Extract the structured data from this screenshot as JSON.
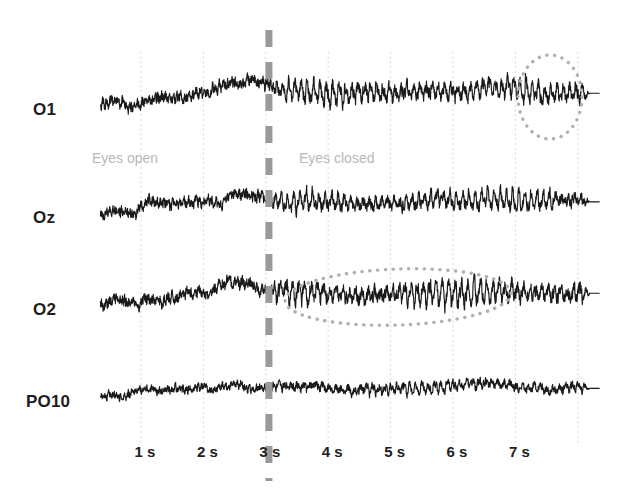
{
  "figure": {
    "width": 626,
    "height": 495,
    "background": "#ffffff"
  },
  "chart_data": {
    "type": "line",
    "title": "",
    "subtitle": "",
    "xlabel": "",
    "ylabel": "",
    "grid": true,
    "legend_position": "none",
    "x": {
      "unit": "s",
      "range": [
        0.35,
        8.35
      ],
      "tick_values": [
        1,
        2,
        3,
        4,
        5,
        6,
        7
      ],
      "tick_labels": [
        "1 s",
        "2 s",
        "3 s",
        "4 s",
        "5 s",
        "6 s",
        "7 s"
      ],
      "gridline_values": [
        1,
        2,
        3,
        4,
        5,
        6,
        7,
        8
      ],
      "gridline_color": "#cfcfcf"
    },
    "series": [
      {
        "name": "O1",
        "label": "O1",
        "baseline_y": 100,
        "trace_color": "#1a1a1a",
        "noise_amplitude_open": 7.5,
        "noise_amplitude_closed": 9.0,
        "alpha_amplitude": 8.5,
        "alpha_frequency_hz": 10.0,
        "drift_rise": 14
      },
      {
        "name": "Oz",
        "label": "Oz",
        "baseline_y": 208,
        "trace_color": "#1a1a1a",
        "noise_amplitude_open": 7.0,
        "noise_amplitude_closed": 8.0,
        "alpha_amplitude": 8.0,
        "alpha_frequency_hz": 10.0,
        "drift_rise": 13
      },
      {
        "name": "O2",
        "label": "O2",
        "baseline_y": 300,
        "trace_color": "#1a1a1a",
        "noise_amplitude_open": 7.5,
        "noise_amplitude_closed": 9.5,
        "alpha_amplitude": 10.5,
        "alpha_frequency_hz": 10.0,
        "drift_rise": 14
      },
      {
        "name": "PO10",
        "label": "PO10",
        "baseline_y": 392,
        "trace_color": "#1a1a1a",
        "noise_amplitude_open": 5.0,
        "noise_amplitude_closed": 5.5,
        "alpha_amplitude": 4.5,
        "alpha_frequency_hz": 10.0,
        "drift_rise": 9
      }
    ],
    "event_marker": {
      "label": "eye-closure",
      "time_value": 3.05,
      "style": "dashed",
      "color": "#9a9a9a",
      "line_width": 7
    },
    "annotations": [
      {
        "kind": "text",
        "name": "eyes-open",
        "text": "Eyes open",
        "x_px": 92,
        "y_px": 158,
        "color": "#b9b9b9"
      },
      {
        "kind": "text",
        "name": "eyes-closed",
        "text": "Eyes closed",
        "x_px": 299,
        "y_px": 158,
        "color": "#b9b9b9"
      },
      {
        "kind": "ellipse",
        "name": "alpha-burst-o1",
        "cx_px": 550,
        "cy_px": 97,
        "rx_px": 32,
        "ry_px": 42,
        "rotation_deg": 0,
        "color": "#b0b0b0",
        "style": "dotted"
      },
      {
        "kind": "ellipse",
        "name": "alpha-burst-o2",
        "cx_px": 398,
        "cy_px": 297,
        "rx_px": 113,
        "ry_px": 28,
        "rotation_deg": -2,
        "color": "#b0b0b0",
        "style": "dotted"
      }
    ]
  },
  "channels": {
    "labels": [
      "O1",
      "Oz",
      "O2",
      "PO10"
    ]
  },
  "axis": {
    "tick_labels": [
      "1 s",
      "2 s",
      "3 s",
      "4 s",
      "5 s",
      "6 s",
      "7 s"
    ]
  },
  "states": {
    "open": "Eyes open",
    "closed": "Eyes closed"
  }
}
